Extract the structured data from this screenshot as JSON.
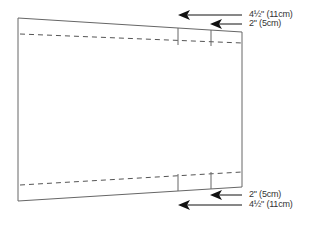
{
  "diagram": {
    "type": "sewing-pattern-piece",
    "colors": {
      "outline": "#666666",
      "dashed": "#555555",
      "arrow": "#111111",
      "text": "#333333"
    },
    "labels": {
      "top_outer": "4½\" (11cm)",
      "top_inner": "2\" (5cm)",
      "bottom_inner": "2\" (5cm)",
      "bottom_outer": "4½\" (11cm)"
    }
  }
}
